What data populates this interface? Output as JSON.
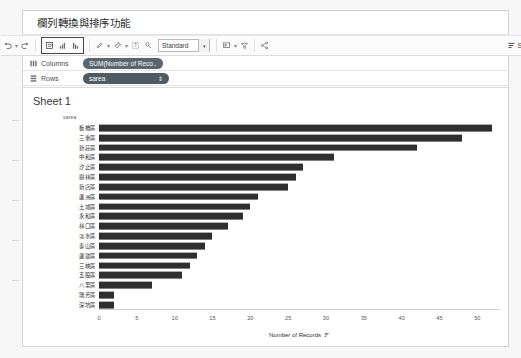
{
  "window": {
    "title": "欄列轉換與排序功能"
  },
  "toolbar": {
    "items": [
      {
        "name": "undo",
        "glyph": "↺",
        "caret": true
      },
      {
        "name": "redo",
        "glyph": "↻",
        "caret": false
      },
      {
        "name": "swap-rows-columns",
        "glyph": "⇄",
        "caret": false
      },
      {
        "name": "sort-ascending",
        "glyph": "↑",
        "caret": false
      },
      {
        "name": "sort-descending",
        "glyph": "↓",
        "caret": false
      },
      {
        "name": "highlight",
        "glyph": "✎",
        "caret": true
      },
      {
        "name": "group-members",
        "glyph": "🖈",
        "caret": true
      },
      {
        "name": "show-mark-labels",
        "glyph": "T",
        "caret": false
      },
      {
        "name": "fix-axes",
        "glyph": "⚲",
        "caret": false
      },
      {
        "name": "presentation-mode",
        "glyph": "▣",
        "caret": true
      },
      {
        "name": "highlighter",
        "glyph": "▽",
        "caret": false
      },
      {
        "name": "share",
        "glyph": "⋖",
        "caret": false
      }
    ],
    "fit_select": "Standard",
    "show_me_label": "Sho"
  },
  "shelves": {
    "columns": {
      "label": "Columns",
      "pill": "SUM(Number of Reco.."
    },
    "rows": {
      "label": "Rows",
      "pill": "sarea",
      "sort_glyph": "⇕"
    }
  },
  "view": {
    "sheet_title": "Sheet 1"
  },
  "chart_data": {
    "type": "bar",
    "orientation": "horizontal",
    "title": "Sheet 1",
    "category_header": "sarea",
    "xlabel": "Number of Records",
    "ylabel": "sarea",
    "xlim": [
      0,
      53
    ],
    "xticks": [
      0,
      5,
      10,
      15,
      20,
      25,
      30,
      35,
      40,
      45,
      50
    ],
    "grid": false,
    "legend": "none",
    "sorted": "descending",
    "bar_color": "#2f2f2f",
    "categories": [
      "板橋區",
      "三重區",
      "新莊區",
      "中和區",
      "汐止區",
      "樹林區",
      "新店區",
      "蘆洲區",
      "土城區",
      "永和區",
      "林口區",
      "淡水區",
      "泰山區",
      "蘆歆區",
      "三峽區",
      "五股區",
      "八里區",
      "瑞芳區",
      "深坑區"
    ],
    "values": [
      52,
      48,
      42,
      31,
      27,
      26,
      25,
      21,
      20,
      19,
      17,
      15,
      14,
      13,
      12,
      11,
      7,
      2,
      2
    ]
  }
}
